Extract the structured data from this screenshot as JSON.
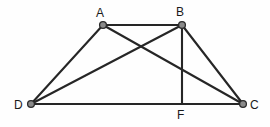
{
  "figure": {
    "background_color": "#fefefe",
    "stroke_color": "#262626",
    "vertex_fill_color": "#8a8a8a",
    "vertex_stroke_color": "#2b2b2b",
    "label_color": "#1a1a1a",
    "width": 270,
    "height": 127
  },
  "points": [
    {
      "id": "A",
      "label": "A",
      "x": 103,
      "y": 25,
      "label_x": 96,
      "label_y": 7,
      "has_dot": true
    },
    {
      "id": "B",
      "label": "B",
      "x": 182,
      "y": 25,
      "label_x": 176,
      "label_y": 6,
      "has_dot": true
    },
    {
      "id": "C",
      "label": "C",
      "x": 243,
      "y": 104,
      "label_x": 250,
      "label_y": 99,
      "has_dot": true
    },
    {
      "id": "D",
      "label": "D",
      "x": 31,
      "y": 104,
      "label_x": 14,
      "label_y": 99,
      "has_dot": true
    },
    {
      "id": "F",
      "label": "F",
      "x": 182,
      "y": 104,
      "label_x": 177,
      "label_y": 109,
      "has_dot": false
    }
  ],
  "segments": [
    {
      "id": "AB",
      "name": "segment-ab",
      "from": "A",
      "to": "B"
    },
    {
      "id": "DC",
      "name": "segment-dc",
      "from": "D",
      "to": "C"
    },
    {
      "id": "AD",
      "name": "segment-ad",
      "from": "A",
      "to": "D"
    },
    {
      "id": "BC",
      "name": "segment-bc",
      "from": "B",
      "to": "C"
    },
    {
      "id": "AC",
      "name": "diagonal-ac",
      "from": "A",
      "to": "C"
    },
    {
      "id": "DB",
      "name": "diagonal-db",
      "from": "D",
      "to": "B"
    },
    {
      "id": "BF",
      "name": "altitude-bf",
      "from": "B",
      "to": "F"
    }
  ]
}
